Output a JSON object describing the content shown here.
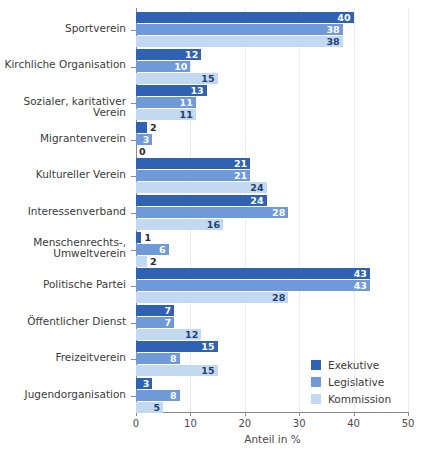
{
  "chart_data": {
    "type": "bar",
    "orientation": "horizontal",
    "title": "",
    "xlabel": "Anteil in %",
    "ylabel": "",
    "xlim": [
      0,
      50
    ],
    "xticks": [
      0,
      10,
      20,
      30,
      40,
      50
    ],
    "xticklabels": [
      "0",
      "10",
      "20",
      "30",
      "40",
      "50"
    ],
    "grid": "vertical",
    "legend_position": "lower-right",
    "categories": [
      "Sportverein",
      "Kirchliche Organisation",
      "Sozialer, karitativer Verein",
      "Migrantenverein",
      "Kultureller Verein",
      "Interessenverband",
      "Menschenrechts-,\nUmweltverein",
      "Politische Partei",
      "Öffentlicher Dienst",
      "Freizeitverein",
      "Jugendorganisation"
    ],
    "series": [
      {
        "name": "Exekutive",
        "color": "#2f62b3",
        "values": [
          40,
          12,
          13,
          2,
          21,
          24,
          1,
          43,
          7,
          15,
          3
        ]
      },
      {
        "name": "Legislative",
        "color": "#6f99d9",
        "values": [
          38,
          10,
          11,
          3,
          21,
          28,
          6,
          43,
          7,
          8,
          8
        ]
      },
      {
        "name": "Kommission",
        "color": "#c3d9f2",
        "values": [
          38,
          15,
          11,
          0,
          24,
          16,
          2,
          28,
          12,
          15,
          5
        ]
      }
    ]
  }
}
